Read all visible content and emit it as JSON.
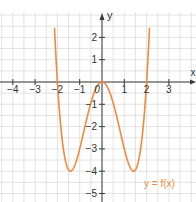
{
  "chart_data": {
    "type": "line",
    "title": "",
    "function_label": "y = f(x)",
    "xlabel": "x",
    "ylabel": "y",
    "x_ticks": [
      -4,
      -3,
      -2,
      -1,
      0,
      1,
      2,
      3
    ],
    "x_tick_labels": [
      "−4",
      "−3",
      "−2",
      "−1",
      "0",
      "1",
      "2",
      "3"
    ],
    "y_ticks": [
      2,
      1,
      -1,
      -2,
      -3,
      -4,
      -5
    ],
    "y_tick_labels": [
      "2",
      "1",
      "−1",
      "−2",
      "−3",
      "−4",
      "−5"
    ],
    "xlim": [
      -4.6,
      4.2
    ],
    "ylim": [
      -5.3,
      3.2
    ],
    "grid": true,
    "grid_step": 0.5,
    "series": [
      {
        "name": "y = f(x)",
        "color": "#f08a3c",
        "x": [
          -2.13,
          -2.0,
          -1.8,
          -1.6,
          -1.414,
          -1.2,
          -1.0,
          -0.8,
          -0.6,
          -0.4,
          -0.2,
          0,
          0.2,
          0.4,
          0.6,
          0.8,
          1.0,
          1.2,
          1.414,
          1.6,
          1.8,
          2.0,
          2.13
        ],
        "y": [
          2.44,
          0,
          -2.47,
          -3.69,
          -4.0,
          -3.69,
          -3.0,
          -2.15,
          -1.31,
          -0.61,
          -0.16,
          0,
          -0.16,
          -0.61,
          -1.31,
          -2.15,
          -3.0,
          -3.69,
          -4.0,
          -3.69,
          -2.47,
          0,
          2.44
        ]
      }
    ],
    "notable_points": {
      "roots": [
        -2,
        0,
        2
      ],
      "local_minima": [
        [
          -1.414,
          -4
        ],
        [
          1.414,
          -4
        ]
      ],
      "local_maximum": [
        0,
        0
      ]
    }
  },
  "colors": {
    "curve": "#f08a3c",
    "axis": "#3a3a3a",
    "grid": "#dcdcdc",
    "label": "#333333",
    "function_label": "#f08a3c"
  }
}
